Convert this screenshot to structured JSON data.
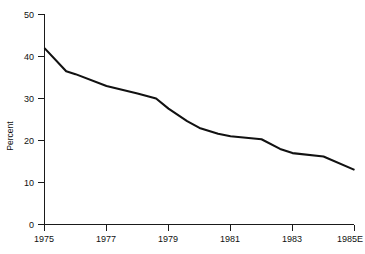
{
  "chart_data": {
    "type": "line",
    "title": "",
    "subtitle": "",
    "xlabel": "",
    "ylabel": "Percent",
    "xlim": [
      1975,
      1985
    ],
    "ylim": [
      0,
      50
    ],
    "grid": false,
    "legend": false,
    "legend_position": "none",
    "line_color": "#111111",
    "x_tick_labels": [
      "1975",
      "1977",
      "1979",
      "1981",
      "1983",
      "1985E"
    ],
    "x_tick_values": [
      1975,
      1977,
      1979,
      1981,
      1983,
      1985
    ],
    "y_tick_labels": [
      "0",
      "10",
      "20",
      "30",
      "40",
      "50"
    ],
    "y_tick_values": [
      0,
      10,
      20,
      30,
      40,
      50
    ],
    "series": [
      {
        "name": "Percent",
        "x": [
          1975,
          1975.7,
          1976.0,
          1977.0,
          1978.0,
          1978.6,
          1979.0,
          1979.6,
          1980.0,
          1980.6,
          1981.0,
          1982.0,
          1982.6,
          1983.0,
          1984.0,
          1985.0
        ],
        "values": [
          42.0,
          36.5,
          35.8,
          33.0,
          31.2,
          30.0,
          27.6,
          24.6,
          23.0,
          21.6,
          21.0,
          20.3,
          18.0,
          17.0,
          16.2,
          13.0
        ]
      }
    ],
    "annotations": []
  },
  "figure": {
    "y_axis_title": "Percent",
    "background_color": "#ffffff",
    "axis_color": "#1a1a1a"
  }
}
